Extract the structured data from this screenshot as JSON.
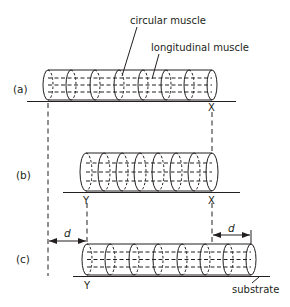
{
  "diagram": {
    "colors": {
      "stroke": "#231f20",
      "background": "#ffffff"
    },
    "labels": {
      "circular_muscle": "circular muscle",
      "longitudinal_muscle": "longitudinal muscle",
      "substrate": "substrate"
    },
    "panels": [
      {
        "id": "a",
        "label": "(a)",
        "points": [
          "X"
        ],
        "segments": 8
      },
      {
        "id": "b",
        "label": "(b)",
        "points": [
          "Y",
          "X"
        ],
        "segments": 8
      },
      {
        "id": "c",
        "label": "(c)",
        "points": [
          "Y"
        ],
        "segments": 8
      }
    ],
    "points": {
      "x": "X",
      "y": "Y"
    },
    "distances": [
      {
        "label": "d",
        "from": "original rear (a)",
        "to": "Y in (c)"
      },
      {
        "label": "d",
        "from": "X in (b)",
        "to": "front in (c)"
      }
    ]
  }
}
